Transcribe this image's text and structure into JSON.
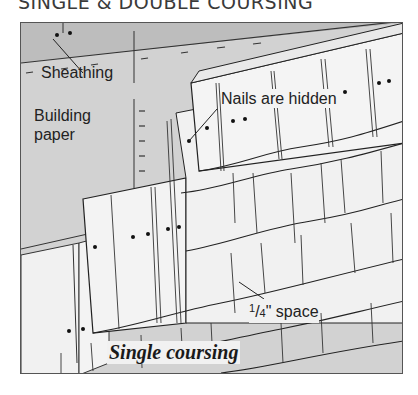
{
  "title": "SINGLE & DOUBLE COURSING",
  "labels": {
    "sheathing": "Sheathing",
    "building_paper_line1": "Building",
    "building_paper_line2": "paper",
    "nails_hidden": "Nails are hidden",
    "space_fraction_num": "1",
    "space_fraction_den": "4",
    "space_suffix": "\" space",
    "caption": "Single coursing"
  },
  "colors": {
    "sheathing": "#b9b9b9",
    "paper": "#cfcfcf",
    "shingle": "#f2f2f2",
    "line": "#2a2a2a"
  }
}
